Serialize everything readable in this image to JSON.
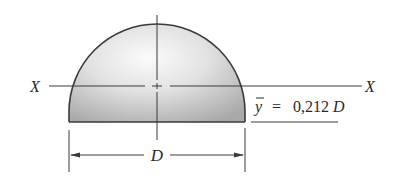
{
  "diagram": {
    "type": "semicircle-centroid",
    "shape": "semicircle",
    "colors": {
      "outline": "#3a3a3a",
      "fill_light": "#f4f4f4",
      "fill_dark": "#b8b8b8",
      "text": "#2a2a2a"
    },
    "axis": {
      "left_label": "X",
      "right_label": "X"
    },
    "centroid": {
      "symbol": "y",
      "equals": "=",
      "value": "0,212",
      "unit_var": "D"
    },
    "dimension": {
      "label": "D"
    }
  }
}
